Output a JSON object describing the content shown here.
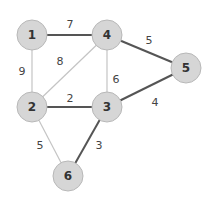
{
  "graph": {
    "nodes": [
      {
        "id": "1",
        "label": "1",
        "x": 32,
        "y": 35
      },
      {
        "id": "4",
        "label": "4",
        "x": 107,
        "y": 35
      },
      {
        "id": "5",
        "label": "5",
        "x": 186,
        "y": 68
      },
      {
        "id": "2",
        "label": "2",
        "x": 32,
        "y": 107
      },
      {
        "id": "3",
        "label": "3",
        "x": 107,
        "y": 107
      },
      {
        "id": "6",
        "label": "6",
        "x": 68,
        "y": 176
      }
    ],
    "node_radius": 15,
    "edges": [
      {
        "from": "1",
        "to": "4",
        "weight": "7",
        "highlighted": true,
        "label_x": 70,
        "label_y": 24
      },
      {
        "from": "1",
        "to": "2",
        "weight": "9",
        "highlighted": false,
        "label_x": 22,
        "label_y": 71
      },
      {
        "from": "2",
        "to": "4",
        "weight": "8",
        "highlighted": false,
        "label_x": 60,
        "label_y": 61
      },
      {
        "from": "4",
        "to": "3",
        "weight": "6",
        "highlighted": false,
        "label_x": 116,
        "label_y": 79
      },
      {
        "from": "4",
        "to": "5",
        "weight": "5",
        "highlighted": true,
        "label_x": 149,
        "label_y": 40
      },
      {
        "from": "2",
        "to": "3",
        "weight": "2",
        "highlighted": true,
        "label_x": 70,
        "label_y": 98
      },
      {
        "from": "3",
        "to": "5",
        "weight": "4",
        "highlighted": true,
        "label_x": 155,
        "label_y": 102
      },
      {
        "from": "2",
        "to": "6",
        "weight": "5",
        "highlighted": false,
        "label_x": 40,
        "label_y": 145
      },
      {
        "from": "3",
        "to": "6",
        "weight": "3",
        "highlighted": true,
        "label_x": 99,
        "label_y": 145
      }
    ],
    "colors": {
      "highlighted_edge": "#555555",
      "normal_edge": "#c4c4c4",
      "node_fill": "#d6d6d6",
      "node_stroke": "#b8b8b8"
    }
  }
}
